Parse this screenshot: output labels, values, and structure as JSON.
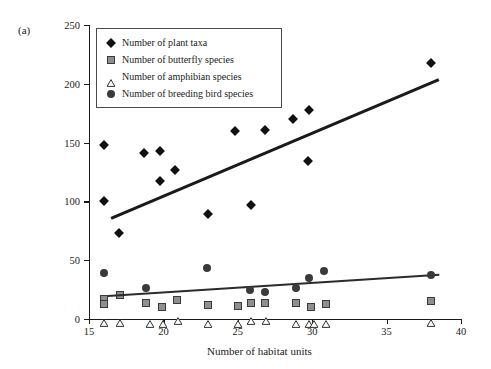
{
  "panel": {
    "label": "(a)"
  },
  "chart_data": {
    "type": "scatter",
    "title": "",
    "xlabel": "Number of habitat units",
    "ylabel": "Number of taxa",
    "xlim": [
      15,
      40
    ],
    "ylim": [
      0,
      250
    ],
    "xticks": [
      15,
      20,
      25,
      30,
      35,
      40
    ],
    "yticks": [
      0,
      50,
      100,
      150,
      200,
      250
    ],
    "grid": false,
    "legend_position": "top-left",
    "series": [
      {
        "name": "Number of plant taxa",
        "marker": "diamond",
        "color": "#111111",
        "points": [
          [
            16.0,
            148
          ],
          [
            16.0,
            100
          ],
          [
            17.0,
            73
          ],
          [
            18.7,
            141
          ],
          [
            19.8,
            143
          ],
          [
            19.8,
            117
          ],
          [
            20.8,
            127
          ],
          [
            23.0,
            89
          ],
          [
            24.8,
            160
          ],
          [
            25.9,
            97
          ],
          [
            26.8,
            161
          ],
          [
            28.7,
            170
          ],
          [
            29.8,
            178
          ],
          [
            29.7,
            134
          ],
          [
            38.0,
            218
          ]
        ],
        "trendline": {
          "x": [
            16.5,
            38.5
          ],
          "y": [
            87,
            205
          ]
        }
      },
      {
        "name": "Number of butterfly species",
        "marker": "square",
        "color": "#8f8f8f",
        "points": [
          [
            16.0,
            17
          ],
          [
            16.0,
            13
          ],
          [
            17.1,
            20
          ],
          [
            18.8,
            14
          ],
          [
            19.9,
            10
          ],
          [
            20.9,
            16
          ],
          [
            23.0,
            12
          ],
          [
            25.0,
            11
          ],
          [
            25.9,
            14
          ],
          [
            26.8,
            14
          ],
          [
            28.9,
            14
          ],
          [
            29.9,
            10
          ],
          [
            30.9,
            13
          ],
          [
            38.0,
            15
          ]
        ],
        "trendline": {
          "x": [
            16.3,
            38.6
          ],
          "y": [
            20,
            38
          ]
        }
      },
      {
        "name": "Number of amphibian species",
        "marker": "triangle",
        "color": "#ffffff",
        "points": [
          [
            16.0,
            2
          ],
          [
            17.1,
            2
          ],
          [
            19.1,
            1
          ],
          [
            20.0,
            1
          ],
          [
            21.0,
            3
          ],
          [
            23.0,
            1
          ],
          [
            25.0,
            1
          ],
          [
            25.9,
            3
          ],
          [
            26.9,
            3
          ],
          [
            28.9,
            1
          ],
          [
            29.8,
            1
          ],
          [
            30.1,
            1
          ],
          [
            30.9,
            1
          ],
          [
            38.0,
            2
          ]
        ]
      },
      {
        "name": "Number of breeding bird species",
        "marker": "circle",
        "color": "#3a3a3a",
        "points": [
          [
            16.0,
            39
          ],
          [
            18.8,
            26
          ],
          [
            22.9,
            43
          ],
          [
            25.8,
            25
          ],
          [
            26.8,
            23
          ],
          [
            28.9,
            26
          ],
          [
            29.8,
            35
          ],
          [
            30.8,
            41
          ],
          [
            38.0,
            37
          ]
        ]
      }
    ]
  }
}
